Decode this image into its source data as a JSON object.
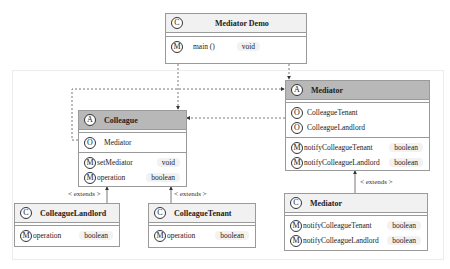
{
  "diagram": {
    "type": "UML class diagram",
    "classes": {
      "mediator_demo": {
        "stereotype_icon": "C",
        "name": "Mediator Demo",
        "kind": "class",
        "methods": [
          {
            "icon": "M",
            "name": "main ()",
            "type": "void"
          }
        ]
      },
      "colleague": {
        "stereotype_icon": "A",
        "name": "Colleague",
        "kind": "abstract",
        "fields": [
          {
            "icon": "O",
            "name": "Mediator"
          }
        ],
        "methods": [
          {
            "icon": "M",
            "name": "setMediator",
            "type": "void"
          },
          {
            "icon": "M",
            "name": "operation",
            "type": "boolean"
          }
        ]
      },
      "mediator_abstract": {
        "stereotype_icon": "A",
        "name": "Mediator",
        "kind": "abstract",
        "fields": [
          {
            "icon": "O",
            "name": "ColleagueTenant"
          },
          {
            "icon": "O",
            "name": "ColleagueLandlord"
          }
        ],
        "methods": [
          {
            "icon": "M",
            "name": "notifyColleagueTenant",
            "type": "boolean"
          },
          {
            "icon": "M",
            "name": "notifyColleagueLandlord",
            "type": "boolean"
          }
        ]
      },
      "colleague_landlord": {
        "stereotype_icon": "C",
        "name": "ColleagueLandlord",
        "kind": "class",
        "methods": [
          {
            "icon": "M",
            "name": "operation",
            "type": "boolean"
          }
        ]
      },
      "colleague_tenant": {
        "stereotype_icon": "C",
        "name": "ColleagueTenant",
        "kind": "class",
        "methods": [
          {
            "icon": "M",
            "name": "operation",
            "type": "boolean"
          }
        ]
      },
      "mediator_concrete": {
        "stereotype_icon": "C",
        "name": "Mediator",
        "kind": "class",
        "methods": [
          {
            "icon": "M",
            "name": "notifyColleagueTenant",
            "type": "boolean"
          },
          {
            "icon": "M",
            "name": "notifyColleagueLandlord",
            "type": "boolean"
          }
        ]
      }
    },
    "relations": {
      "extends_label": "< extends >"
    },
    "colors": {
      "abstract_header": "#b8b8b8",
      "concrete_header": "#f1f1f1",
      "border": "#9a9a9a",
      "type_pill": "#f2f2f2"
    }
  }
}
